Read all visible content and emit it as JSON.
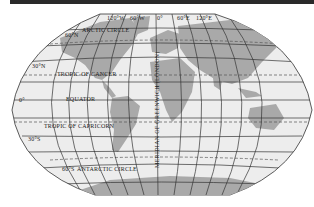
{
  "map": {
    "projection": "Aitoff / Winkel-style world map",
    "colors": {
      "ocean": "#ededed",
      "land": "#a9a9a9",
      "grid": "#333333",
      "special_parallels": "#555555",
      "top_bar": "#2a2a2a"
    },
    "longitude_labels": [
      "120°W",
      "60°W",
      "0°",
      "60°E",
      "120°E"
    ],
    "latitude_labels": [
      "60°N",
      "30°N",
      "0°",
      "30°S",
      "60°S"
    ],
    "special_parallels": {
      "arctic": "ARCTIC CIRCLE",
      "cancer": "TROPIC OF CANCER",
      "equator": "EQUATOR",
      "capricorn": "TROPIC OF CAPRICORN",
      "antarctic": "ANTARCTIC CIRCLE"
    },
    "prime_meridian_label": "MERIDIAN OF GREENWICH (LONDON)"
  }
}
